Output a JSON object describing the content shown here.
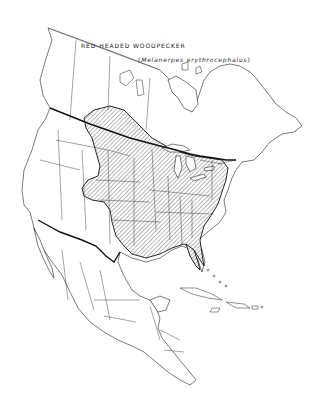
{
  "map": {
    "title": "RED-HEADED WOODPECKER",
    "subtitle_open": "(",
    "scientific_name": "Melanerpes erythrocephalus",
    "subtitle_close": ")",
    "region": "North America",
    "legend": {
      "hatched_area": "breeding range"
    },
    "colors": {
      "background": "#ffffff",
      "outline": "#222222",
      "hatch": "#333333"
    }
  }
}
